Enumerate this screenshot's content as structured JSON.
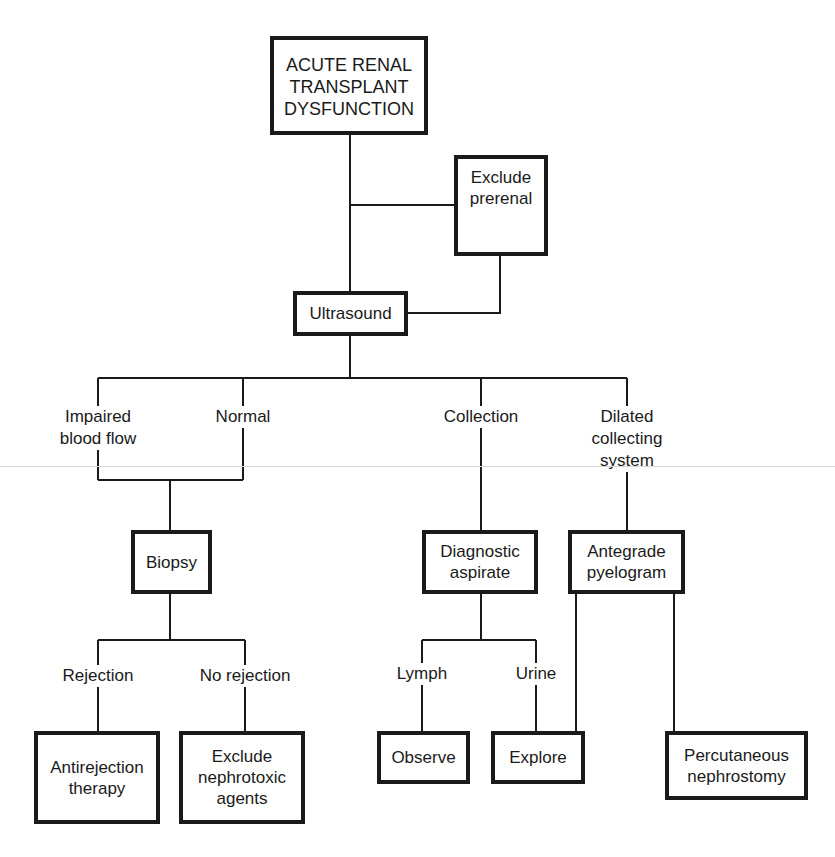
{
  "diagram": {
    "title_box": "ACUTE RENAL\nTRANSPLANT\nDYSFUNCTION",
    "nodes": {
      "exclude_prerenal": "Exclude\nprerenal",
      "ultrasound": "Ultrasound",
      "biopsy": "Biopsy",
      "diagnostic_aspirate": "Diagnostic\naspirate",
      "antegrade_pyelogram": "Antegrade\npyelogram",
      "antirejection_therapy": "Antirejection\ntherapy",
      "exclude_nephrotoxic": "Exclude\nnephrotoxic\nagents",
      "observe": "Observe",
      "explore": "Explore",
      "percutaneous_nephrostomy": "Percutaneous\nnephrostomy"
    },
    "branch_labels": {
      "impaired_blood_flow": "Impaired\nblood flow",
      "normal": "Normal",
      "collection": "Collection",
      "dilated_collecting_system": "Dilated\ncollecting\nsystem",
      "rejection": "Rejection",
      "no_rejection": "No rejection",
      "lymph": "Lymph",
      "urine": "Urine"
    },
    "edges": [
      [
        "ACUTE RENAL TRANSPLANT DYSFUNCTION",
        "Ultrasound"
      ],
      [
        "ACUTE RENAL TRANSPLANT DYSFUNCTION",
        "Exclude prerenal"
      ],
      [
        "Exclude prerenal",
        "Ultrasound"
      ],
      [
        "Ultrasound",
        "Impaired blood flow"
      ],
      [
        "Ultrasound",
        "Normal"
      ],
      [
        "Ultrasound",
        "Collection"
      ],
      [
        "Ultrasound",
        "Dilated collecting system"
      ],
      [
        "Impaired blood flow",
        "Biopsy"
      ],
      [
        "Normal",
        "Biopsy"
      ],
      [
        "Collection",
        "Diagnostic aspirate"
      ],
      [
        "Dilated collecting system",
        "Antegrade pyelogram"
      ],
      [
        "Biopsy",
        "Rejection"
      ],
      [
        "Biopsy",
        "No rejection"
      ],
      [
        "Rejection",
        "Antirejection therapy"
      ],
      [
        "No rejection",
        "Exclude nephrotoxic agents"
      ],
      [
        "Diagnostic aspirate",
        "Lymph"
      ],
      [
        "Diagnostic aspirate",
        "Urine"
      ],
      [
        "Lymph",
        "Observe"
      ],
      [
        "Urine",
        "Explore"
      ],
      [
        "Antegrade pyelogram",
        "Explore"
      ],
      [
        "Antegrade pyelogram",
        "Percutaneous nephrostomy"
      ]
    ]
  }
}
